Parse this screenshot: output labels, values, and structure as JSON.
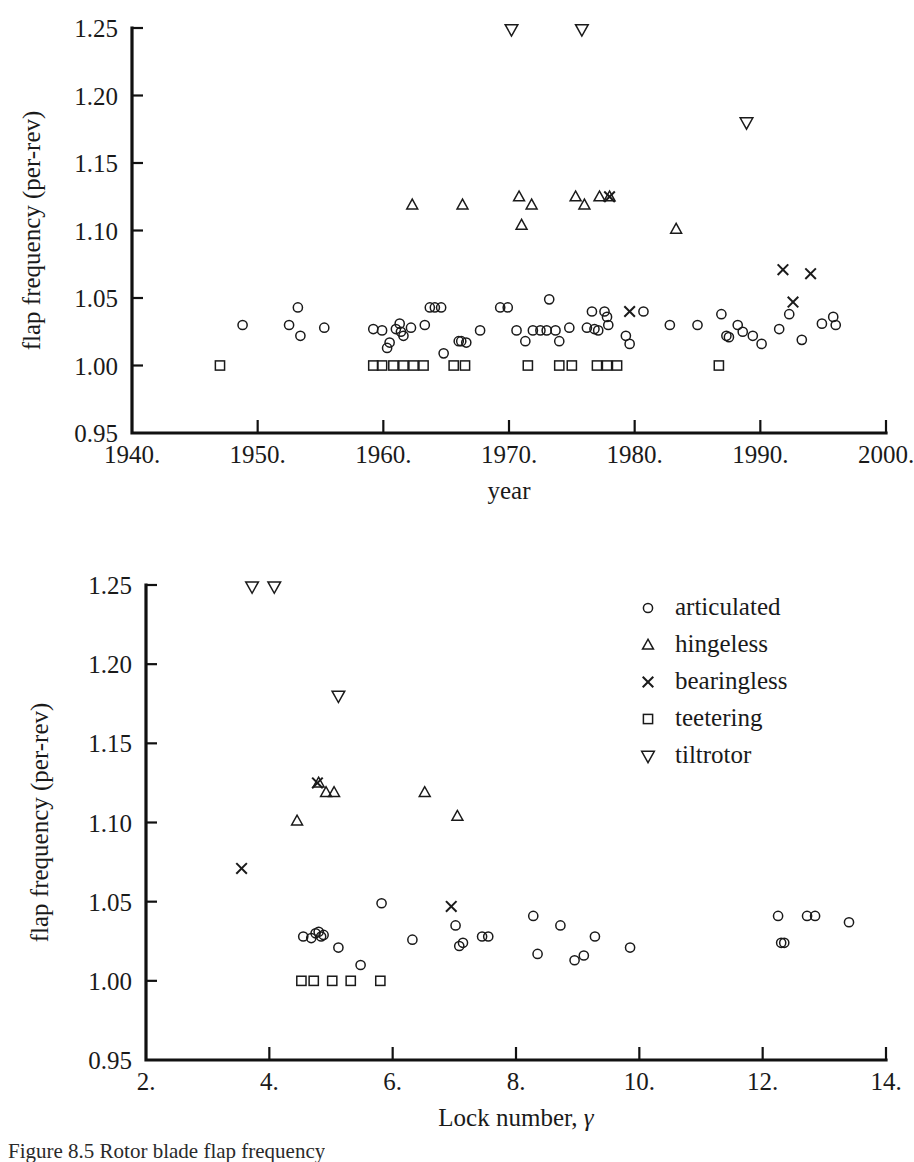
{
  "figure": {
    "caption": "Figure 8.5  Rotor blade flap frequency",
    "marker_legend_title": ""
  },
  "legend": {
    "position": "upper-right-of-lower-panel",
    "entries": [
      {
        "symbol": "circle",
        "label": "articulated"
      },
      {
        "symbol": "triangle-up",
        "label": "hingeless"
      },
      {
        "symbol": "cross",
        "label": "bearingless"
      },
      {
        "symbol": "square",
        "label": "teetering"
      },
      {
        "symbol": "triangle-down",
        "label": "tiltrotor"
      }
    ]
  },
  "chart_data": [
    {
      "type": "scatter",
      "title": "",
      "xlabel": "year",
      "ylabel": "flap frequency (per-rev)",
      "xlim": [
        1940,
        2000
      ],
      "ylim": [
        0.95,
        1.25
      ],
      "xticks": [
        1940,
        1950,
        1960,
        1970,
        1980,
        1990,
        2000
      ],
      "xticklabels": [
        "1940.",
        "1950.",
        "1960.",
        "1970.",
        "1980.",
        "1990.",
        "2000."
      ],
      "yticks": [
        0.95,
        1.0,
        1.05,
        1.1,
        1.15,
        1.2,
        1.25
      ],
      "yticklabels": [
        "0.95",
        "1.00",
        "1.05",
        "1.10",
        "1.15",
        "1.20",
        "1.25"
      ],
      "grid": false,
      "legend": false,
      "series": [
        {
          "name": "articulated",
          "symbol": "circle",
          "points": [
            [
              1948.8,
              1.03
            ],
            [
              1952.5,
              1.03
            ],
            [
              1953.2,
              1.043
            ],
            [
              1953.4,
              1.022
            ],
            [
              1955.3,
              1.028
            ],
            [
              1959.2,
              1.027
            ],
            [
              1959.9,
              1.026
            ],
            [
              1960.3,
              1.013
            ],
            [
              1960.5,
              1.017
            ],
            [
              1961.0,
              1.027
            ],
            [
              1961.3,
              1.031
            ],
            [
              1961.4,
              1.025
            ],
            [
              1961.6,
              1.022
            ],
            [
              1962.2,
              1.028
            ],
            [
              1963.3,
              1.03
            ],
            [
              1963.7,
              1.043
            ],
            [
              1964.1,
              1.043
            ],
            [
              1964.6,
              1.043
            ],
            [
              1964.8,
              1.009
            ],
            [
              1966.0,
              1.018
            ],
            [
              1966.2,
              1.018
            ],
            [
              1966.6,
              1.017
            ],
            [
              1967.7,
              1.026
            ],
            [
              1969.3,
              1.043
            ],
            [
              1969.9,
              1.043
            ],
            [
              1970.6,
              1.026
            ],
            [
              1971.3,
              1.018
            ],
            [
              1971.9,
              1.026
            ],
            [
              1972.5,
              1.026
            ],
            [
              1973.0,
              1.026
            ],
            [
              1973.2,
              1.049
            ],
            [
              1973.7,
              1.026
            ],
            [
              1974.0,
              1.018
            ],
            [
              1974.8,
              1.028
            ],
            [
              1976.2,
              1.028
            ],
            [
              1976.6,
              1.04
            ],
            [
              1976.8,
              1.027
            ],
            [
              1977.1,
              1.026
            ],
            [
              1977.6,
              1.04
            ],
            [
              1977.8,
              1.036
            ],
            [
              1977.9,
              1.03
            ],
            [
              1979.3,
              1.022
            ],
            [
              1979.6,
              1.016
            ],
            [
              1980.7,
              1.04
            ],
            [
              1982.8,
              1.03
            ],
            [
              1985.0,
              1.03
            ],
            [
              1986.9,
              1.038
            ],
            [
              1987.3,
              1.022
            ],
            [
              1987.5,
              1.021
            ],
            [
              1988.2,
              1.03
            ],
            [
              1988.6,
              1.025
            ],
            [
              1989.4,
              1.022
            ],
            [
              1990.1,
              1.016
            ],
            [
              1991.5,
              1.027
            ],
            [
              1992.3,
              1.038
            ],
            [
              1993.3,
              1.019
            ],
            [
              1994.9,
              1.031
            ],
            [
              1995.8,
              1.036
            ],
            [
              1996.0,
              1.03
            ]
          ]
        },
        {
          "name": "hingeless",
          "symbol": "triangle-up",
          "points": [
            [
              1962.3,
              1.119
            ],
            [
              1966.3,
              1.119
            ],
            [
              1970.8,
              1.125
            ],
            [
              1971.0,
              1.104
            ],
            [
              1971.8,
              1.119
            ],
            [
              1975.3,
              1.125
            ],
            [
              1976.0,
              1.119
            ],
            [
              1977.2,
              1.125
            ],
            [
              1978.0,
              1.125
            ],
            [
              1983.3,
              1.101
            ]
          ]
        },
        {
          "name": "bearingless",
          "symbol": "cross",
          "points": [
            [
              1978.0,
              1.125
            ],
            [
              1979.6,
              1.04
            ],
            [
              1991.8,
              1.071
            ],
            [
              1992.6,
              1.047
            ],
            [
              1994.0,
              1.068
            ]
          ]
        },
        {
          "name": "teetering",
          "symbol": "square",
          "points": [
            [
              1947.0,
              1.0
            ],
            [
              1959.2,
              1.0
            ],
            [
              1959.9,
              1.0
            ],
            [
              1960.8,
              1.0
            ],
            [
              1961.6,
              1.0
            ],
            [
              1962.4,
              1.0
            ],
            [
              1963.2,
              1.0
            ],
            [
              1965.6,
              1.0
            ],
            [
              1966.5,
              1.0
            ],
            [
              1971.5,
              1.0
            ],
            [
              1974.0,
              1.0
            ],
            [
              1975.0,
              1.0
            ],
            [
              1977.0,
              1.0
            ],
            [
              1977.8,
              1.0
            ],
            [
              1978.6,
              1.0
            ],
            [
              1986.7,
              1.0
            ]
          ]
        },
        {
          "name": "tiltrotor",
          "symbol": "triangle-down",
          "points": [
            [
              1970.2,
              1.249
            ],
            [
              1975.8,
              1.249
            ],
            [
              1988.9,
              1.18
            ]
          ]
        }
      ]
    },
    {
      "type": "scatter",
      "title": "",
      "xlabel": "Lock number, γ",
      "ylabel": "flap frequency (per-rev)",
      "xlim": [
        2,
        14
      ],
      "ylim": [
        0.95,
        1.25
      ],
      "xticks": [
        2,
        4,
        6,
        8,
        10,
        12,
        14
      ],
      "xticklabels": [
        "2.",
        "4.",
        "6.",
        "8.",
        "10.",
        "12.",
        "14."
      ],
      "yticks": [
        0.95,
        1.0,
        1.05,
        1.1,
        1.15,
        1.2,
        1.25
      ],
      "yticklabels": [
        "0.95",
        "1.00",
        "1.05",
        "1.10",
        "1.15",
        "1.20",
        "1.25"
      ],
      "grid": false,
      "legend": true,
      "series": [
        {
          "name": "articulated",
          "symbol": "circle",
          "points": [
            [
              4.55,
              1.028
            ],
            [
              4.68,
              1.027
            ],
            [
              4.75,
              1.03
            ],
            [
              4.8,
              1.031
            ],
            [
              4.84,
              1.028
            ],
            [
              4.88,
              1.029
            ],
            [
              5.12,
              1.021
            ],
            [
              5.48,
              1.01
            ],
            [
              5.82,
              1.049
            ],
            [
              6.32,
              1.026
            ],
            [
              7.02,
              1.035
            ],
            [
              7.08,
              1.022
            ],
            [
              7.14,
              1.024
            ],
            [
              7.45,
              1.028
            ],
            [
              7.55,
              1.028
            ],
            [
              8.28,
              1.041
            ],
            [
              8.35,
              1.017
            ],
            [
              8.72,
              1.035
            ],
            [
              8.95,
              1.013
            ],
            [
              9.1,
              1.016
            ],
            [
              9.28,
              1.028
            ],
            [
              9.85,
              1.021
            ],
            [
              12.25,
              1.041
            ],
            [
              12.3,
              1.024
            ],
            [
              12.35,
              1.024
            ],
            [
              12.72,
              1.041
            ],
            [
              12.85,
              1.041
            ],
            [
              13.4,
              1.037
            ]
          ]
        },
        {
          "name": "hingeless",
          "symbol": "triangle-up",
          "points": [
            [
              4.45,
              1.101
            ],
            [
              4.8,
              1.125
            ],
            [
              4.92,
              1.119
            ],
            [
              5.05,
              1.119
            ],
            [
              6.52,
              1.119
            ],
            [
              7.05,
              1.104
            ]
          ]
        },
        {
          "name": "bearingless",
          "symbol": "cross",
          "points": [
            [
              3.55,
              1.071
            ],
            [
              4.78,
              1.125
            ],
            [
              6.95,
              1.047
            ]
          ]
        },
        {
          "name": "teetering",
          "symbol": "square",
          "points": [
            [
              4.52,
              1.0
            ],
            [
              4.72,
              1.0
            ],
            [
              5.02,
              1.0
            ],
            [
              5.32,
              1.0
            ],
            [
              5.8,
              1.0
            ]
          ]
        },
        {
          "name": "tiltrotor",
          "symbol": "triangle-down",
          "points": [
            [
              3.72,
              1.249
            ],
            [
              4.08,
              1.249
            ],
            [
              5.12,
              1.18
            ]
          ]
        }
      ]
    }
  ]
}
